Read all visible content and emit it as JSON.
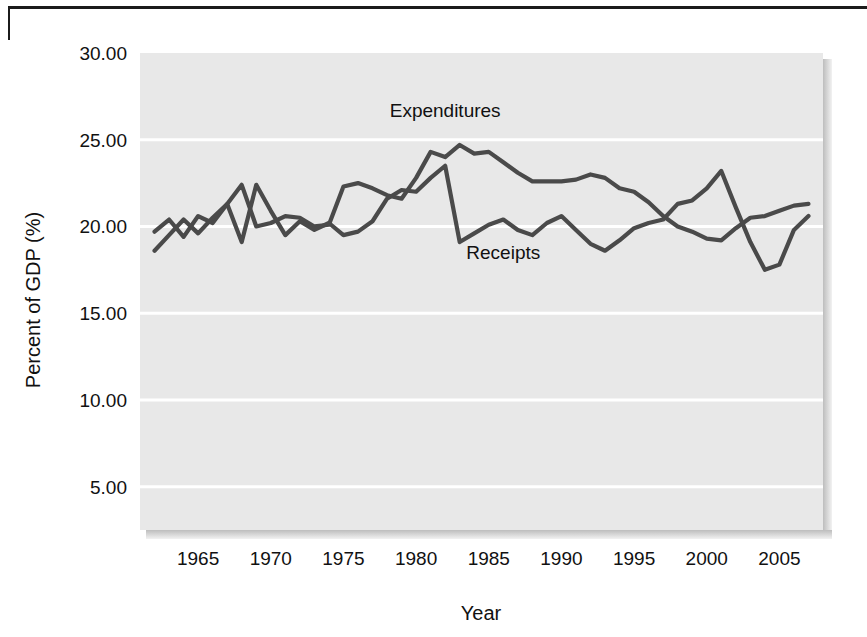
{
  "figure": {
    "background_color": "#ffffff",
    "plot_background_color": "#e8e8e8",
    "gridline_color": "#ffffff",
    "line_color": "#4a4a4a",
    "rule_color": "#1b1b1b"
  },
  "chart_data": {
    "type": "line",
    "title": "",
    "xlabel": "Year",
    "ylabel": "Percent of GDP (%)",
    "xlim": [
      1961,
      2008
    ],
    "ylim": [
      2.5,
      30
    ],
    "xticks": [
      1965,
      1970,
      1975,
      1980,
      1985,
      1990,
      1995,
      2000,
      2005
    ],
    "xticklabels": [
      "1965",
      "1970",
      "1975",
      "1980",
      "1985",
      "1990",
      "1995",
      "2000",
      "2005"
    ],
    "yticks": [
      5,
      10,
      15,
      20,
      25,
      30
    ],
    "yticklabels": [
      "5.00",
      "10.00",
      "15.00",
      "20.00",
      "25.00",
      "30.00"
    ],
    "grid": true,
    "grid_axis": "y",
    "legend": "inline-annotations",
    "annotations": [
      {
        "text": "Expenditures",
        "x": 1982.0,
        "y": 26.3
      },
      {
        "text": "Receipts",
        "x": 1986.0,
        "y": 18.1
      }
    ],
    "x": [
      1962,
      1963,
      1964,
      1965,
      1966,
      1967,
      1968,
      1969,
      1970,
      1971,
      1972,
      1973,
      1974,
      1975,
      1976,
      1977,
      1978,
      1979,
      1980,
      1981,
      1982,
      1983,
      1984,
      1985,
      1986,
      1987,
      1988,
      1989,
      1990,
      1991,
      1992,
      1993,
      1994,
      1995,
      1996,
      1997,
      1998,
      1999,
      2000,
      2001,
      2002,
      2003,
      2004,
      2005,
      2006,
      2007
    ],
    "series": [
      {
        "name": "Expenditures",
        "values": [
          19.7,
          20.4,
          19.4,
          20.6,
          20.2,
          21.3,
          22.4,
          20.0,
          20.2,
          20.6,
          20.5,
          20.0,
          20.1,
          22.3,
          22.5,
          22.2,
          21.8,
          21.6,
          22.8,
          24.3,
          24.0,
          24.7,
          24.2,
          24.3,
          23.7,
          23.1,
          22.6,
          22.6,
          22.6,
          22.7,
          23.0,
          22.8,
          22.2,
          22.0,
          21.4,
          20.6,
          20.0,
          19.7,
          19.3,
          19.2,
          19.9,
          20.5,
          20.6,
          20.9,
          21.2,
          21.3
        ]
      },
      {
        "name": "Receipts",
        "values": [
          18.6,
          19.5,
          20.4,
          19.6,
          20.5,
          21.3,
          19.1,
          22.4,
          20.9,
          19.5,
          20.3,
          19.8,
          20.2,
          19.5,
          19.7,
          20.3,
          21.6,
          22.1,
          22.0,
          22.8,
          23.5,
          19.1,
          19.6,
          20.1,
          20.4,
          19.8,
          19.5,
          20.2,
          20.6,
          19.8,
          19.0,
          18.6,
          19.2,
          19.9,
          20.2,
          20.4,
          21.3,
          21.5,
          22.2,
          23.2,
          21.1,
          19.1,
          17.5,
          17.8,
          19.8,
          20.6
        ]
      }
    ]
  }
}
